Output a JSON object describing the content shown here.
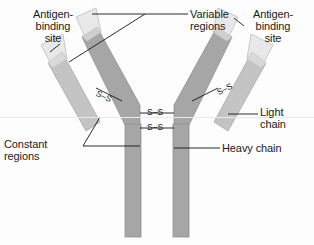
{
  "figure": {
    "background_color": "#fdfdfd"
  },
  "labels": {
    "antigen_binding_left": "Antigen-\nbinding\nsite",
    "antigen_binding_right": "Antigen-\nbinding\nsite",
    "variable_regions": "Variable\nregions",
    "constant_regions": "Constant\nregions",
    "light_chain": "Light\nchain",
    "heavy_chain": "Heavy chain"
  },
  "bonds": {
    "disulfide_label": "S–S",
    "center_upper": "S–S",
    "center_lower": "S–S",
    "left_arm": "S–S",
    "right_arm": "S–S",
    "count": 4
  },
  "colors": {
    "variable_region_fill": "#e6e6e6",
    "variable_region_edge": "#c9c9c9",
    "light_chain_fill": "#c4c4c4",
    "heavy_chain_fill": "#a6a6a6",
    "outline": "#9a9a9a",
    "leader_line": "#151515",
    "text": "#1a1a1a"
  },
  "parts": [
    {
      "name": "light-chain-left",
      "region": "left",
      "chain": "light",
      "has_variable_tip": true
    },
    {
      "name": "heavy-chain-left",
      "region": "left",
      "chain": "heavy",
      "has_variable_tip": true
    },
    {
      "name": "heavy-chain-right",
      "region": "right",
      "chain": "heavy",
      "has_variable_tip": true
    },
    {
      "name": "light-chain-right",
      "region": "right",
      "chain": "light",
      "has_variable_tip": true
    }
  ]
}
